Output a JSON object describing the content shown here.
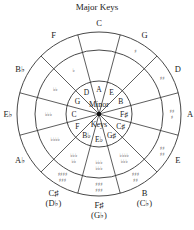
{
  "title": "Major Keys",
  "center_labels": [
    "Minor",
    "Keys"
  ],
  "geometry": {
    "cx": 99,
    "cy": 114,
    "r_outer": 82,
    "r_middle": 64,
    "r_inner": 33
  },
  "major_keys": [
    {
      "label": "C",
      "alt": ""
    },
    {
      "label": "G",
      "alt": ""
    },
    {
      "label": "D",
      "alt": ""
    },
    {
      "label": "A",
      "alt": ""
    },
    {
      "label": "E",
      "alt": ""
    },
    {
      "label": "B",
      "alt": "(C♭)"
    },
    {
      "label": "F♯",
      "alt": "(G♭)"
    },
    {
      "label": "C♯",
      "alt": "(D♭)"
    },
    {
      "label": "A♭",
      "alt": ""
    },
    {
      "label": "E♭",
      "alt": ""
    },
    {
      "label": "B♭",
      "alt": ""
    },
    {
      "label": "F",
      "alt": ""
    }
  ],
  "signatures": [
    {
      "outer": [],
      "middle": []
    },
    {
      "outer": [
        "♯"
      ],
      "middle": []
    },
    {
      "outer": [
        "♯♯"
      ],
      "middle": []
    },
    {
      "outer": [
        "♯♯",
        "♯"
      ],
      "middle": []
    },
    {
      "outer": [
        "♯♯",
        "♯♯"
      ],
      "middle": []
    },
    {
      "outer": [],
      "middle": [
        "♯♯♯",
        "♯♯"
      ]
    },
    {
      "outer": [],
      "middle": [
        "♯♯♯",
        "♯♯♯"
      ]
    },
    {
      "outer": [],
      "middle": [
        "♯♯♯♯",
        "♯♯♯"
      ]
    },
    {
      "outer": [],
      "middle": [
        "♭♭♭♭"
      ]
    },
    {
      "outer": [],
      "middle": [
        "♭♭♭"
      ]
    },
    {
      "outer": [],
      "middle": [
        "♭♭"
      ]
    },
    {
      "outer": [],
      "middle": [
        "♭"
      ]
    }
  ],
  "inner_signatures": [
    {
      "index": 5,
      "lines": [
        "♭♭♭♭",
        "♭♭♭"
      ]
    },
    {
      "index": 6,
      "lines": [
        "♭♭♭",
        "♭♭♭"
      ]
    },
    {
      "index": 7,
      "lines": [
        "♭♭♭",
        "♭♭"
      ]
    }
  ],
  "minor_keys": [
    "A",
    "E",
    "B",
    "F♯",
    "C♯",
    "G♯",
    "E♭",
    "B♭",
    "F",
    "C",
    "G",
    "D"
  ]
}
